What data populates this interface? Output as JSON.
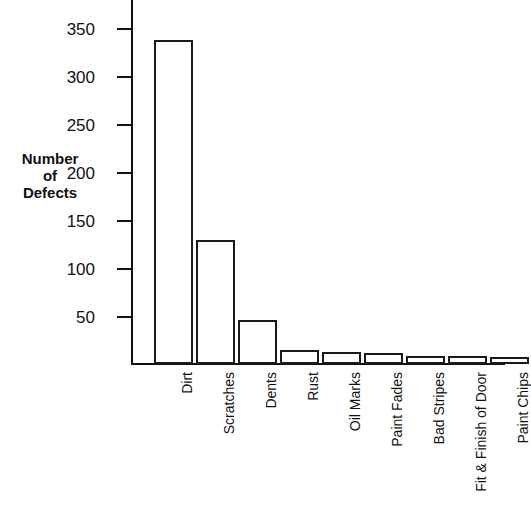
{
  "chart_data": {
    "type": "bar",
    "title": "",
    "subtitle": "",
    "xlabel": "",
    "ylabel": "Number of Defects",
    "ylabel_lines": [
      "Number",
      "of",
      "Defects"
    ],
    "categories": [
      "Dirt",
      "Scratches",
      "Dents",
      "Rust",
      "Oil Marks",
      "Paint Fades",
      "Bad Stripes",
      "Fit & Finish of Door",
      "Paint Chips"
    ],
    "values": [
      338,
      129,
      46,
      15,
      12,
      11,
      8,
      8,
      7
    ],
    "ylim": [
      0,
      365
    ],
    "yticks": [
      50,
      100,
      150,
      200,
      250,
      300,
      350
    ],
    "ytick_labels": [
      "50",
      "100",
      "150",
      "200",
      "250",
      "300",
      "350"
    ],
    "grid": false,
    "legend": false,
    "legend_position": "none",
    "bar_fill_color": "#ffffff",
    "bar_edge_color": "#1a1a1a",
    "axis_color": "#111111",
    "background_color": "#ffffff"
  }
}
